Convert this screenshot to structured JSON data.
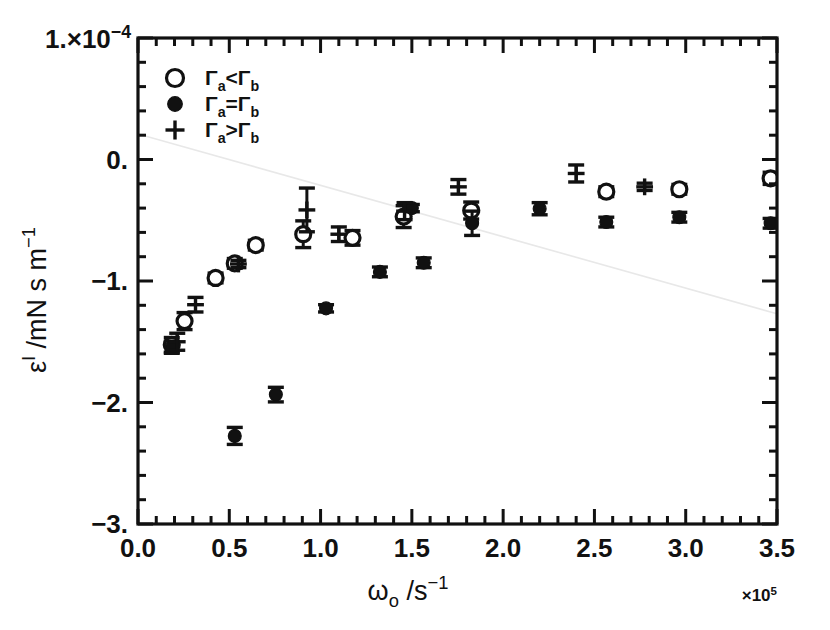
{
  "figure": {
    "background": "#ffffff",
    "foreground": "#111111",
    "faint_line_color": "#e8e8e8"
  },
  "axes": {
    "x": {
      "title_main": "ω",
      "title_sub": "o",
      "title_rest": " /s",
      "title_sup": "−1",
      "multiplier_pre": "×10",
      "multiplier_sup": "5",
      "ticklabels": [
        "0.0",
        "0.5",
        "1.0",
        "1.5",
        "2.0",
        "2.5",
        "3.0",
        "3.5"
      ],
      "tickvalues": [
        0.0,
        0.5,
        1.0,
        1.5,
        2.0,
        2.5,
        3.0,
        3.5
      ],
      "minor_per_major": 5,
      "range": [
        0.0,
        3.5
      ]
    },
    "y": {
      "title_main": "ε",
      "title_sup": "I",
      "title_rest": " /mN s m",
      "title_sup2": "−1",
      "top_label_pre": "1.×10",
      "top_label_sup": "−4",
      "ticklabels": [
        "0.",
        "−1.",
        "−2.",
        "−3."
      ],
      "tickvalues": [
        0.0,
        -1.0,
        -2.0,
        -3.0
      ],
      "top_value": 1.0,
      "minor_per_major": 5,
      "range": [
        -3.0,
        1.0
      ]
    }
  },
  "legend": {
    "entries": [
      {
        "marker": "open-circle",
        "label_a": "Γ",
        "sub_a": "a",
        "op": "<",
        "label_b": "Γ",
        "sub_b": "b"
      },
      {
        "marker": "filled-circle",
        "label_a": "Γ",
        "sub_a": "a",
        "op": "=",
        "label_b": "Γ",
        "sub_b": "b"
      },
      {
        "marker": "plus",
        "label_a": "Γ",
        "sub_a": "a",
        "op": ">",
        "label_b": "Γ",
        "sub_b": "b"
      }
    ]
  },
  "chart_data": {
    "type": "scatter",
    "title": "",
    "xlabel": "ωo /s⁻¹  (×10⁵)",
    "ylabel": "ε' /mN s m⁻¹  (×10⁻⁴)",
    "xlim": [
      0.0,
      3.5
    ],
    "ylim": [
      -3.0,
      1.0
    ],
    "grid": false,
    "legend_position": "upper-left-inside",
    "series": [
      {
        "name": "Γa < Γb",
        "marker": "open-circle",
        "points": [
          {
            "x": 0.185,
            "y": -1.525,
            "yerr": 0.06
          },
          {
            "x": 0.255,
            "y": -1.33,
            "yerr": 0.07
          },
          {
            "x": 0.425,
            "y": -0.975,
            "yerr": 0.04
          },
          {
            "x": 0.53,
            "y": -0.855,
            "yerr": 0.04
          },
          {
            "x": 0.645,
            "y": -0.705,
            "yerr": 0.04
          },
          {
            "x": 0.905,
            "y": -0.615,
            "yerr": 0.11
          },
          {
            "x": 1.175,
            "y": -0.645,
            "yerr": 0.06
          },
          {
            "x": 1.455,
            "y": -0.47,
            "yerr": 0.09
          },
          {
            "x": 1.825,
            "y": -0.42,
            "yerr": 0.07
          },
          {
            "x": 2.565,
            "y": -0.265,
            "yerr": 0.04
          },
          {
            "x": 2.965,
            "y": -0.245,
            "yerr": 0.04
          },
          {
            "x": 3.465,
            "y": -0.155,
            "yerr": 0.05
          }
        ]
      },
      {
        "name": "Γa = Γb",
        "marker": "filled-circle",
        "points": [
          {
            "x": 0.185,
            "y": -1.545,
            "yerr": 0.05
          },
          {
            "x": 0.53,
            "y": -2.275,
            "yerr": 0.07
          },
          {
            "x": 0.755,
            "y": -1.935,
            "yerr": 0.06
          },
          {
            "x": 1.03,
            "y": -1.225,
            "yerr": 0.03
          },
          {
            "x": 1.325,
            "y": -0.925,
            "yerr": 0.04
          },
          {
            "x": 1.5,
            "y": -0.4,
            "yerr": 0.03
          },
          {
            "x": 1.565,
            "y": -0.85,
            "yerr": 0.04
          },
          {
            "x": 1.83,
            "y": -0.525,
            "yerr": 0.1
          },
          {
            "x": 2.2,
            "y": -0.405,
            "yerr": 0.05
          },
          {
            "x": 2.565,
            "y": -0.515,
            "yerr": 0.04
          },
          {
            "x": 2.965,
            "y": -0.475,
            "yerr": 0.04
          },
          {
            "x": 3.465,
            "y": -0.525,
            "yerr": 0.04
          }
        ]
      },
      {
        "name": "Γa > Γb",
        "marker": "plus",
        "points": [
          {
            "x": 0.215,
            "y": -1.5,
            "yerr": 0.07
          },
          {
            "x": 0.315,
            "y": -1.195,
            "yerr": 0.06
          },
          {
            "x": 0.55,
            "y": -0.86,
            "yerr": 0.03
          },
          {
            "x": 0.925,
            "y": -0.415,
            "yerr": 0.18
          },
          {
            "x": 1.1,
            "y": -0.615,
            "yerr": 0.06
          },
          {
            "x": 1.46,
            "y": -0.425,
            "yerr": 0.07
          },
          {
            "x": 1.755,
            "y": -0.225,
            "yerr": 0.06
          },
          {
            "x": 2.4,
            "y": -0.115,
            "yerr": 0.07
          },
          {
            "x": 2.775,
            "y": -0.225,
            "yerr": 0.03
          }
        ]
      }
    ],
    "trend_line": {
      "name": "faint-guide-line",
      "x0": 0.0,
      "y0": 0.21,
      "x1": 3.5,
      "y1": -1.27,
      "color": "#e8e8e8"
    }
  }
}
